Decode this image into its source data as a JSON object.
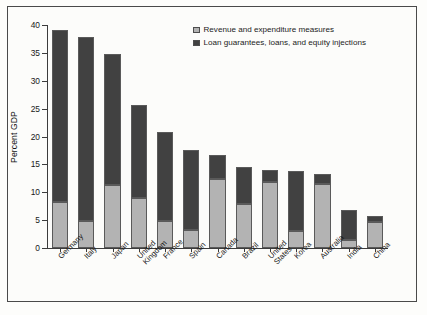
{
  "chart_data": {
    "type": "bar",
    "subtype": "stacked-bar",
    "title": "",
    "xlabel": "",
    "ylabel": "Percent GDP",
    "ylim": [
      0,
      40
    ],
    "yticks": [
      0,
      5,
      10,
      15,
      20,
      25,
      30,
      35,
      40
    ],
    "ytick_labels": [
      "0",
      "5",
      "10",
      "15",
      "20",
      "25",
      "30",
      "35",
      "40"
    ],
    "grid": false,
    "legend_position": "top-right",
    "categories": [
      "Germany",
      "Italy",
      "Japan",
      "United\nKingdom",
      "France",
      "Spain",
      "Canada",
      "Brazil",
      "United\nStates",
      "Korea",
      "Australia",
      "India",
      "China"
    ],
    "series": [
      {
        "name": "Revenue and expenditure measures",
        "color": "#b3b3b3",
        "values": [
          8.3,
          4.9,
          11.3,
          8.9,
          4.9,
          3.2,
          12.3,
          7.9,
          11.9,
          3.0,
          11.4,
          1.5,
          4.6
        ]
      },
      {
        "name": "Loan guarantees, loans, and equity injections",
        "color": "#414141",
        "values": [
          30.8,
          33.0,
          23.5,
          16.7,
          16.0,
          14.4,
          4.3,
          6.6,
          2.1,
          10.8,
          1.8,
          5.4,
          1.1
        ]
      }
    ],
    "totals": [
      39.1,
      37.9,
      34.8,
      25.6,
      20.9,
      17.6,
      16.6,
      14.5,
      14.0,
      13.8,
      13.2,
      6.9,
      5.7
    ]
  },
  "legend": {
    "items": [
      {
        "label": "Revenue and expenditure measures",
        "swatch": "light"
      },
      {
        "label": "Loan guarantees, loans, and equity injections",
        "swatch": "dark"
      }
    ]
  },
  "colors": {
    "light_segment": "#b3b3b3",
    "dark_segment": "#414141",
    "axis": "#3c3c3c",
    "frame": "#4a4a4a",
    "background": "#fcfcfa",
    "text": "#141414"
  }
}
